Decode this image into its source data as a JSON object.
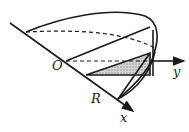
{
  "figure": {
    "type": "solid-cross-section-diagram",
    "labels": {
      "origin": "O",
      "radius": "R",
      "x_axis": "x",
      "y_axis": "y"
    },
    "colors": {
      "line": "#1a1a1a",
      "shade": "#bdbdbd",
      "background": "#ffffff"
    }
  }
}
